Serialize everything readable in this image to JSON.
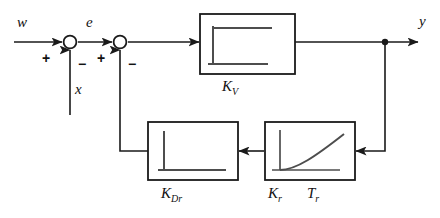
{
  "diagram": {
    "type": "block-diagram",
    "colors": {
      "line": "#1a1a1a",
      "glyph": "#555555",
      "background": "#ffffff"
    },
    "signals": {
      "reference": "w",
      "error": "e",
      "disturbance": "x",
      "output": "y"
    },
    "summing_junctions": [
      {
        "id": "sum1",
        "x": 70,
        "y": 42,
        "inputs": [
          {
            "label": "+",
            "from": "w",
            "side": "left"
          },
          {
            "label": "−",
            "from": "x",
            "side": "bottom"
          }
        ]
      },
      {
        "id": "sum2",
        "x": 120,
        "y": 42,
        "inputs": [
          {
            "label": "+",
            "from": "e",
            "side": "left"
          },
          {
            "label": "−",
            "from": "K_Dr",
            "side": "bottom"
          }
        ]
      }
    ],
    "blocks": [
      {
        "id": "kv",
        "label_main": "K",
        "label_sub": "V",
        "label_text": "K_V",
        "response": "step",
        "path": "forward",
        "x": 200,
        "y": 14,
        "w": 95,
        "h": 60
      },
      {
        "id": "kdr",
        "label_main": "K",
        "label_sub": "Dr",
        "label_text": "K_Dr",
        "response": "impulse",
        "path": "inner-feedback",
        "x": 148,
        "y": 122,
        "w": 90,
        "h": 58
      },
      {
        "id": "kr",
        "label_main": "K",
        "label_sub": "r",
        "label_main2": "T",
        "label_sub2": "r",
        "label_text": "K_r  T_r",
        "response": "first-order-lag",
        "path": "outer-feedback",
        "x": 265,
        "y": 122,
        "w": 90,
        "h": 58
      }
    ],
    "nodes": [
      {
        "id": "output-tap",
        "x": 385,
        "y": 42,
        "type": "junction-dot"
      }
    ]
  }
}
